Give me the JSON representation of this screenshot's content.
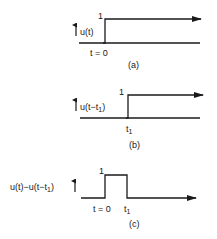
{
  "panels": [
    {
      "id": "a",
      "caption": "(a)",
      "function_label": "u(t)",
      "amplitude_label": "1",
      "time_labels": [
        "t = 0"
      ],
      "description": "Unit step function starting at t = 0"
    },
    {
      "id": "b",
      "caption": "(b)",
      "function_label_main": "u(t−t",
      "function_label_sub": "1",
      "function_label_close": ")",
      "amplitude_label": "1",
      "time_label_main": "t",
      "time_label_sub": "1",
      "description": "Unit step delayed to t = t1"
    },
    {
      "id": "c",
      "caption": "(c)",
      "function_label_main": "u(t)−u(t−t",
      "function_label_sub": "1",
      "function_label_close": ")",
      "amplitude_label": "1",
      "time_label_zero": "t = 0",
      "time_label_main": "t",
      "time_label_sub": "1",
      "description": "Rectangular pulse from t = 0 to t = t1"
    }
  ],
  "colors": {
    "line": "#1a1a1a",
    "background": "#ffffff"
  }
}
